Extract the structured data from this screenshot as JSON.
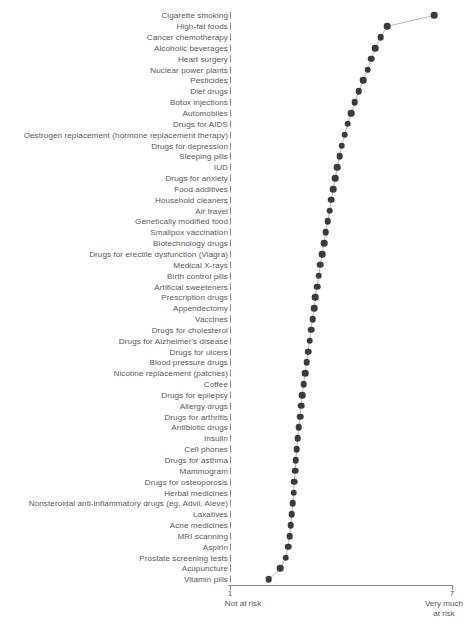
{
  "chart_data": {
    "type": "scatter",
    "title": "",
    "subtitle": "",
    "xlabel": "",
    "ylabel": "",
    "xlim": [
      1,
      7
    ],
    "grid": false,
    "legend": null,
    "orientation": "horizontal-dot-plot",
    "axis": {
      "left_tick_label": "1",
      "right_tick_label": "7",
      "left_caption": "Not at risk",
      "right_caption_line1": "Very much",
      "right_caption_line2": "at risk"
    },
    "categories": [
      "Cigarette smoking",
      "High-fat foods",
      "Cancer chemotherapy",
      "Alcoholic beverages",
      "Heart surgery",
      "Nuclear power plants",
      "Pesticides",
      "Diet drugs",
      "Botox injections",
      "Automobiles",
      "Drugs for AIDS",
      "Oestrogen replacement (hormone replacement therapy)",
      "Drugs for depression",
      "Sleeping pills",
      "IUD",
      "Drugs for anxiety",
      "Food additives",
      "Household cleaners",
      "Air travel",
      "Genetically modified food",
      "Smallpox vaccination",
      "Biotechnology drugs",
      "Drugs for erectile dysfunction (Viagra)",
      "Medical X-rays",
      "Birth control pills",
      "Artificial sweeteners",
      "Prescription drugs",
      "Appendectomy",
      "Vaccines",
      "Drugs for cholesterol",
      "Drugs for Alzheimer's disease",
      "Drugs for ulcers",
      "Blood pressure drugs",
      "Nicotine replacement (patches)",
      "Coffee",
      "Drugs for epilepsy",
      "Allergy drugs",
      "Drugs for arthritis",
      "Antibiotic drugs",
      "Insulin",
      "Cell phones",
      "Drugs for asthma",
      "Mammogram",
      "Drugs for osteoporosis",
      "Herbal medicines",
      "Nonsteroidal anti-inflammatory drugs (eg, Advil, Aleve)",
      "Laxatives",
      "Acne medicines",
      "MRI scanning",
      "Aspirin",
      "Prostate screening tests",
      "Acupuncture",
      "Vitamin pills"
    ],
    "values": [
      6.52,
      5.25,
      5.07,
      4.93,
      4.82,
      4.72,
      4.6,
      4.48,
      4.37,
      4.28,
      4.18,
      4.1,
      4.02,
      3.96,
      3.9,
      3.85,
      3.79,
      3.74,
      3.69,
      3.64,
      3.59,
      3.54,
      3.49,
      3.44,
      3.4,
      3.35,
      3.31,
      3.27,
      3.23,
      3.19,
      3.15,
      3.11,
      3.07,
      3.03,
      2.99,
      2.95,
      2.92,
      2.89,
      2.86,
      2.83,
      2.8,
      2.78,
      2.76,
      2.74,
      2.72,
      2.7,
      2.67,
      2.64,
      2.61,
      2.57,
      2.5,
      2.35,
      2.05
    ],
    "marker": {
      "shape": "circle",
      "color": "#3b3b3d",
      "size_px": 6.6
    },
    "connector_line": {
      "visible": true,
      "color": "#9a9a9a",
      "width_px": 0.7
    }
  },
  "figure": {
    "caption": ""
  },
  "colors": {
    "marker": "#3b3b3d",
    "line": "#9a9a9a",
    "axis": "#8c8c8c",
    "text": "#58595b",
    "background": "#ffffff"
  }
}
